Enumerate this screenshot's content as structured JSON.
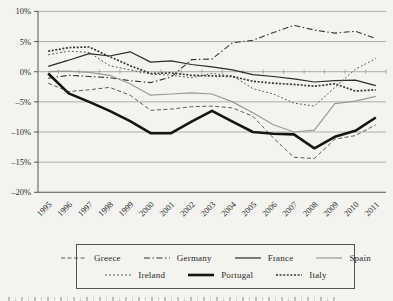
{
  "chart_data": {
    "type": "line",
    "title": "",
    "xlabel": "",
    "ylabel": "",
    "x_categories": [
      "1995",
      "1996",
      "1997",
      "1998",
      "1999",
      "2000",
      "2001",
      "2002",
      "2003",
      "2004",
      "2005",
      "2006",
      "2007",
      "2008",
      "2009",
      "2010",
      "2011"
    ],
    "ytick_labels": [
      "10%",
      "5%",
      "0%",
      "–5%",
      "–10%",
      "–15%",
      "–20%"
    ],
    "ytick_values": [
      10,
      5,
      0,
      -5,
      -10,
      -15,
      -20
    ],
    "ylim": [
      -20,
      10
    ],
    "grid": true,
    "legend_position": "bottom-boxed",
    "axis_color": "#555555",
    "grid_color": "#9a9a9a",
    "series": [
      {
        "name": "greece",
        "label": "Greece",
        "color": "#4a4a4a",
        "width": 0.9,
        "dash": "4 2.5",
        "values": [
          -1.9,
          -3.3,
          -3.0,
          -2.6,
          -3.9,
          -6.4,
          -6.2,
          -5.8,
          -5.7,
          -6.0,
          -7.4,
          -11.0,
          -14.2,
          -14.4,
          -11.2,
          -10.6,
          -8.8
        ]
      },
      {
        "name": "germany",
        "label": "Germany",
        "color": "#333333",
        "width": 1.1,
        "dash": "6 2.5 1.5 2.5",
        "values": [
          -1.1,
          -0.6,
          -0.8,
          -1.0,
          -1.5,
          -1.8,
          -0.9,
          2.0,
          2.1,
          4.8,
          5.2,
          6.5,
          7.7,
          6.9,
          6.4,
          6.7,
          5.5
        ]
      },
      {
        "name": "france",
        "label": "France",
        "color": "#2b2b2b",
        "width": 1.2,
        "dash": "",
        "values": [
          0.9,
          1.9,
          3.0,
          2.6,
          3.3,
          1.6,
          1.8,
          1.2,
          0.8,
          0.3,
          -0.5,
          -0.8,
          -1.2,
          -1.7,
          -1.5,
          -1.4,
          -2.3
        ]
      },
      {
        "name": "spain",
        "label": "Spain",
        "color": "#9a9a9a",
        "width": 1.2,
        "dash": "",
        "values": [
          0.0,
          0.1,
          -0.1,
          -0.6,
          -2.0,
          -3.9,
          -3.7,
          -3.5,
          -3.7,
          -5.0,
          -6.8,
          -8.8,
          -10.0,
          -9.7,
          -5.3,
          -4.9,
          -4.1
        ]
      },
      {
        "name": "ireland",
        "label": "Ireland",
        "color": "#555555",
        "width": 1.0,
        "dash": "1.8 2.2",
        "values": [
          2.8,
          3.4,
          3.2,
          1.0,
          0.3,
          -0.4,
          -0.6,
          -1.0,
          -0.3,
          -0.7,
          -2.8,
          -3.7,
          -5.2,
          -5.7,
          -2.6,
          0.4,
          2.2
        ]
      },
      {
        "name": "portugal",
        "label": "Portugal",
        "color": "#151515",
        "width": 2.6,
        "dash": "",
        "values": [
          -0.3,
          -3.6,
          -5.0,
          -6.5,
          -8.2,
          -10.2,
          -10.2,
          -8.3,
          -6.5,
          -8.3,
          -10.0,
          -10.3,
          -10.4,
          -12.7,
          -10.8,
          -9.8,
          -7.6
        ]
      },
      {
        "name": "italy",
        "label": "Italy",
        "color": "#3a3a3a",
        "width": 1.7,
        "dash": "2 1.6",
        "values": [
          3.4,
          4.0,
          4.1,
          2.5,
          1.0,
          -0.3,
          -0.2,
          -0.6,
          -0.7,
          -0.8,
          -1.6,
          -1.9,
          -2.1,
          -2.4,
          -2.0,
          -3.2,
          -3.0
        ]
      }
    ],
    "legend_rows": [
      [
        "greece",
        "germany",
        "france",
        "spain"
      ],
      [
        "ireland",
        "portugal",
        "italy"
      ]
    ]
  }
}
